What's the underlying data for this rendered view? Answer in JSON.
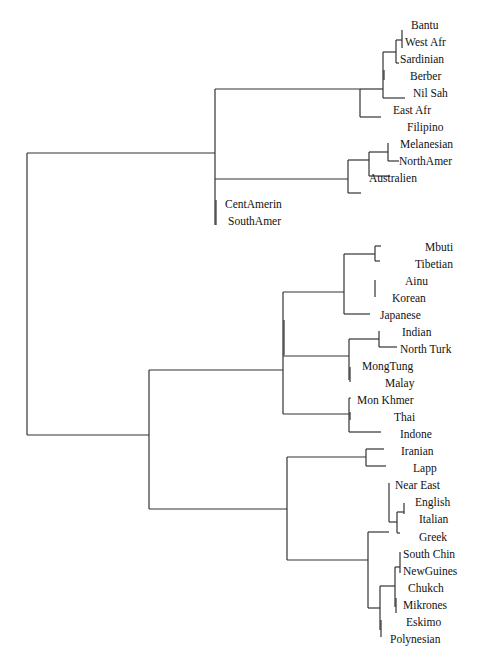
{
  "diagram": {
    "type": "dendrogram",
    "leaves": [
      {
        "label": "Bantu",
        "x": 411,
        "y": 29
      },
      {
        "label": "West Afr",
        "x": 405,
        "y": 46
      },
      {
        "label": "Sardinian",
        "x": 400,
        "y": 63
      },
      {
        "label": "Berber",
        "x": 410,
        "y": 80
      },
      {
        "label": "Nil Sah",
        "x": 413,
        "y": 97
      },
      {
        "label": "East Afr",
        "x": 393,
        "y": 114
      },
      {
        "label": "Filipino",
        "x": 407,
        "y": 131
      },
      {
        "label": "Melanesian",
        "x": 400,
        "y": 148
      },
      {
        "label": "NorthAmer",
        "x": 399,
        "y": 165
      },
      {
        "label": "Australien",
        "x": 369,
        "y": 182
      },
      {
        "label": "CentAmerin",
        "x": 225,
        "y": 208
      },
      {
        "label": "SouthAmer",
        "x": 228,
        "y": 225
      },
      {
        "label": "Mbuti",
        "x": 425,
        "y": 251
      },
      {
        "label": "Tibetian",
        "x": 415,
        "y": 268
      },
      {
        "label": "Ainu",
        "x": 405,
        "y": 285
      },
      {
        "label": "Korean",
        "x": 392,
        "y": 302
      },
      {
        "label": "Japanese",
        "x": 380,
        "y": 319
      },
      {
        "label": "Indian",
        "x": 402,
        "y": 336
      },
      {
        "label": "North Turk",
        "x": 400,
        "y": 353
      },
      {
        "label": "MongTung",
        "x": 362,
        "y": 370
      },
      {
        "label": "Malay",
        "x": 385,
        "y": 387
      },
      {
        "label": "Mon Khmer",
        "x": 357,
        "y": 404
      },
      {
        "label": "Thai",
        "x": 394,
        "y": 421
      },
      {
        "label": "Indone",
        "x": 400,
        "y": 438
      },
      {
        "label": "Iranian",
        "x": 401,
        "y": 455
      },
      {
        "label": "Lapp",
        "x": 413,
        "y": 472
      },
      {
        "label": "Near East",
        "x": 395,
        "y": 489
      },
      {
        "label": "English",
        "x": 415,
        "y": 506
      },
      {
        "label": "Italian",
        "x": 419,
        "y": 523
      },
      {
        "label": "Greek",
        "x": 419,
        "y": 541
      },
      {
        "label": "South Chin",
        "x": 403,
        "y": 558
      },
      {
        "label": "NewGuines",
        "x": 403,
        "y": 575
      },
      {
        "label": "Chukch",
        "x": 408,
        "y": 592
      },
      {
        "label": "Mikrones",
        "x": 403,
        "y": 609
      },
      {
        "label": "Eskimo",
        "x": 406,
        "y": 626
      },
      {
        "label": "Polynesian",
        "x": 390,
        "y": 643
      }
    ],
    "line_color": "#333333"
  }
}
